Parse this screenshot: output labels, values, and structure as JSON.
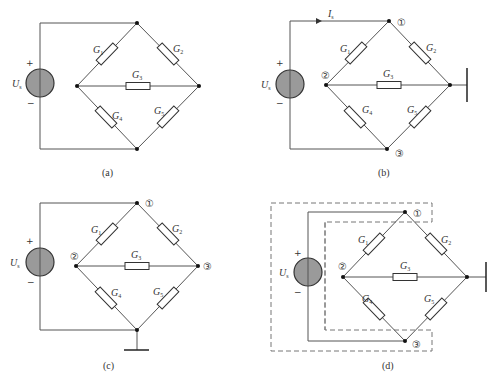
{
  "figure": {
    "panels": [
      {
        "caption": "(a)",
        "source": {
          "label": "U",
          "subscript": "s",
          "plus": "+",
          "minus": "−"
        },
        "resistors": [
          "G1",
          "G2",
          "G3",
          "G4",
          "G5"
        ],
        "node_labels": [],
        "ground": "none"
      },
      {
        "caption": "(b)",
        "source": {
          "label": "U",
          "subscript": "s",
          "plus": "+",
          "minus": "−"
        },
        "current": {
          "label": "I",
          "subscript": "s"
        },
        "resistors": [
          "G1",
          "G2",
          "G3",
          "G4",
          "G5"
        ],
        "node_labels": [
          "①",
          "②",
          "③"
        ],
        "ground": "right node"
      },
      {
        "caption": "(c)",
        "source": {
          "label": "U",
          "subscript": "s",
          "plus": "+",
          "minus": "−"
        },
        "resistors": [
          "G1",
          "G2",
          "G3",
          "G4",
          "G5"
        ],
        "node_labels": [
          "①",
          "②",
          "③"
        ],
        "ground": "bottom node"
      },
      {
        "caption": "(d)",
        "source": {
          "label": "U",
          "subscript": "s",
          "plus": "+",
          "minus": "−"
        },
        "resistors": [
          "G1",
          "G2",
          "G3",
          "G4",
          "G5"
        ],
        "node_labels": [
          "①",
          "②",
          "③"
        ],
        "ground": "right node",
        "dashed_enclosures": 2
      }
    ],
    "labels": {
      "G": "G",
      "sub1": "1",
      "sub2": "2",
      "sub3": "3",
      "sub4": "4",
      "sub5": "5",
      "U": "U",
      "I": "I",
      "s": "s",
      "plus": "+",
      "minus": "−",
      "n1": "①",
      "n2": "②",
      "n3": "③",
      "cap_a": "(a)",
      "cap_b": "(b)",
      "cap_c": "(c)",
      "cap_d": "(d)"
    }
  }
}
